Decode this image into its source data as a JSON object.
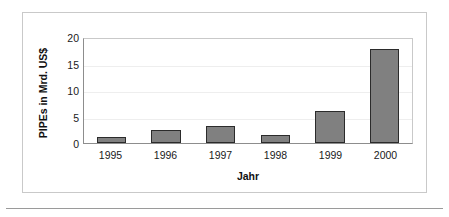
{
  "chart_data": {
    "type": "bar",
    "title": "",
    "xlabel": "Jahr",
    "ylabel": "PIPEs in Mrd. US$",
    "categories": [
      "1995",
      "1996",
      "1997",
      "1998",
      "1999",
      "2000"
    ],
    "values": [
      1.1,
      2.5,
      3.2,
      1.5,
      6.0,
      17.8
    ],
    "series": [
      {
        "name": "PIPEs",
        "values": [
          1.1,
          2.5,
          3.2,
          1.5,
          6.0,
          17.8
        ]
      }
    ],
    "ylim": [
      0,
      20
    ],
    "yticks": [
      0,
      5,
      10,
      15,
      20
    ],
    "ytick_labels": [
      "0",
      "5",
      "10",
      "15",
      "20"
    ],
    "grid": true,
    "legend": false,
    "legend_position": "none",
    "bar_color": "#808080",
    "bar_edge_color": "#2b2b2b",
    "axis_color": "#8d8d8d",
    "gridline_color": "#eeeeee",
    "frame_color": "#c9c9c9",
    "background": "#ffffff"
  },
  "figure": {
    "border_color": "#c9c9c9",
    "rule_color": "#9a9a9a"
  }
}
